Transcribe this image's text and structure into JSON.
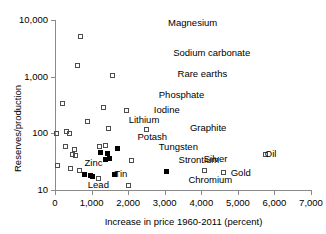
{
  "chart_data": {
    "type": "scatter",
    "title": "",
    "xlabel": "Increase in price 1960-2011 (percent)",
    "ylabel": "Reserves/production",
    "xlim": [
      0,
      7000
    ],
    "ylim": [
      10,
      10000
    ],
    "yscale": "log",
    "xscale": "linear",
    "grid": false,
    "legend": "none",
    "xticks": [
      "0",
      "1,000",
      "2,000",
      "3,000",
      "4,000",
      "5,000",
      "6,000",
      "7,000"
    ],
    "xtick_values": [
      0,
      1000,
      2000,
      3000,
      4000,
      5000,
      6000,
      7000
    ],
    "yticks": [
      "10",
      "100",
      "1,000",
      "10,000"
    ],
    "ytick_values": [
      10,
      100,
      1000,
      10000
    ],
    "marker_styles": {
      "open": "hollow square (metals/minerals)",
      "filled": "solid black square (highlighted commodities)"
    },
    "points": [
      {
        "label": "Magnesium",
        "x": 700,
        "y": 5200,
        "fill": "open",
        "lx": 120,
        "ly": -14
      },
      {
        "label": "Sodium carbonate",
        "x": 620,
        "y": 1600,
        "fill": "open",
        "lx": 128,
        "ly": -13
      },
      {
        "label": "Rare earths",
        "x": 1560,
        "y": 1050,
        "fill": "open",
        "lx": 98,
        "ly": -2
      },
      {
        "label": "Phosphate",
        "x": 1320,
        "y": 290,
        "fill": "open",
        "lx": 88,
        "ly": -13
      },
      {
        "label": "Iodine",
        "x": 1950,
        "y": 250,
        "fill": "open",
        "lx": 60,
        "ly": -2
      },
      {
        "label": "Lithium",
        "x": 880,
        "y": 165,
        "fill": "open",
        "lx": 74,
        "ly": -2
      },
      {
        "label": "Potash",
        "x": 1450,
        "y": 122,
        "fill": "open",
        "lx": 62,
        "ly": 8
      },
      {
        "label": "Graphite",
        "x": 2500,
        "y": 118,
        "fill": "open",
        "lx": 76,
        "ly": -2
      },
      {
        "label": "Tungsten",
        "x": 1700,
        "y": 55,
        "fill": "filled",
        "lx": 74,
        "ly": -2
      },
      {
        "label": "Strontium",
        "x": 2080,
        "y": 33,
        "fill": "open",
        "lx": 80,
        "ly": -2
      },
      {
        "label": "Silver",
        "x": 4080,
        "y": 22,
        "fill": "open",
        "lx": 32,
        "ly": -13
      },
      {
        "label": "Gold",
        "x": 4600,
        "y": 20,
        "fill": "open",
        "lx": 40,
        "ly": -1
      },
      {
        "label": "Oil",
        "x": 5750,
        "y": 42,
        "fill": "open",
        "lx": 32,
        "ly": -2
      },
      {
        "label": "Chromium",
        "x": 3060,
        "y": 21,
        "fill": "filled",
        "lx": 54,
        "ly": 7
      },
      {
        "label": "Zinc",
        "x": 820,
        "y": 19,
        "fill": "filled",
        "lx": 32,
        "ly": -12
      },
      {
        "label": "Tin",
        "x": 1640,
        "y": 19,
        "fill": "filled",
        "lx": 32,
        "ly": -1
      },
      {
        "label": "Lead",
        "x": 1020,
        "y": 17,
        "fill": "filled",
        "lx": 28,
        "ly": 7
      },
      {
        "label": "",
        "x": 210,
        "y": 330,
        "fill": "open"
      },
      {
        "label": "",
        "x": 40,
        "y": 100,
        "fill": "open"
      },
      {
        "label": "",
        "x": 310,
        "y": 106,
        "fill": "open"
      },
      {
        "label": "",
        "x": 400,
        "y": 100,
        "fill": "open"
      },
      {
        "label": "",
        "x": 300,
        "y": 58,
        "fill": "open"
      },
      {
        "label": "",
        "x": 520,
        "y": 52,
        "fill": "open"
      },
      {
        "label": "",
        "x": 470,
        "y": 43,
        "fill": "open"
      },
      {
        "label": "",
        "x": 560,
        "y": 40,
        "fill": "open"
      },
      {
        "label": "",
        "x": 1230,
        "y": 58,
        "fill": "open"
      },
      {
        "label": "",
        "x": 1390,
        "y": 60,
        "fill": "open"
      },
      {
        "label": "",
        "x": 1250,
        "y": 45,
        "fill": "filled"
      },
      {
        "label": "",
        "x": 1430,
        "y": 44,
        "fill": "filled"
      },
      {
        "label": "",
        "x": 1500,
        "y": 36,
        "fill": "filled"
      },
      {
        "label": "",
        "x": 1380,
        "y": 34,
        "fill": "filled"
      },
      {
        "label": "",
        "x": 60,
        "y": 27,
        "fill": "open"
      },
      {
        "label": "",
        "x": 430,
        "y": 24,
        "fill": "open"
      },
      {
        "label": "",
        "x": 680,
        "y": 22,
        "fill": "open"
      },
      {
        "label": "",
        "x": 980,
        "y": 18,
        "fill": "filled"
      },
      {
        "label": "",
        "x": 1180,
        "y": 16,
        "fill": "open"
      },
      {
        "label": "",
        "x": 2020,
        "y": 12,
        "fill": "open"
      }
    ]
  },
  "axes": {
    "ylabel": "Reserves/production",
    "xlabel": "Increase in price 1960-2011 (percent)"
  }
}
